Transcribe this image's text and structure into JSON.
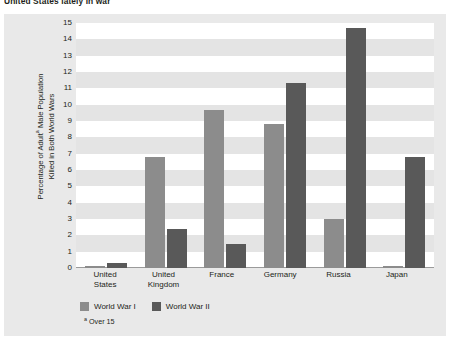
{
  "page": {
    "heading": "United States lately in war"
  },
  "chart_data": {
    "type": "bar",
    "title": "",
    "xlabel": "",
    "ylabel": "Percentage of Adultᵃ Male Population Killed in Both World Wars",
    "ylabel_line1": "Percentage of Adult",
    "ylabel_sup": "a",
    "ylabel_line2": " Male Population",
    "ylabel_line3": "Killed in Both World Wars",
    "categories": [
      "United States",
      "United Kingdom",
      "France",
      "Germany",
      "Russia",
      "Japan"
    ],
    "category_lines": [
      [
        "United",
        "States"
      ],
      [
        "United",
        "Kingdom"
      ],
      [
        "France",
        ""
      ],
      [
        "Germany",
        ""
      ],
      [
        "Russia",
        ""
      ],
      [
        "Japan",
        ""
      ]
    ],
    "series": [
      {
        "name": "World War I",
        "color": "#8c8c8c",
        "values": [
          0.1,
          6.8,
          9.7,
          8.8,
          3.0,
          0.1
        ]
      },
      {
        "name": "World War II",
        "color": "#595959",
        "values": [
          0.3,
          2.4,
          1.5,
          11.3,
          14.7,
          6.8
        ]
      }
    ],
    "yticks": [
      15,
      14,
      13,
      12,
      11,
      10,
      9,
      8,
      7,
      6,
      5,
      4,
      3,
      2,
      1,
      0
    ],
    "ylim": [
      0,
      15
    ],
    "grid": true,
    "grid_style": "alternating-horizontal-bands",
    "legend_position": "bottom-left",
    "footnote": "Over 15",
    "footnote_marker": "a"
  },
  "colors": {
    "panel_background": "#e9e9e9",
    "plot_background": "#ffffff",
    "band": "#e4e4e4",
    "axis": "#9a9a9a",
    "text": "#231f20",
    "series_ww1": "#8c8c8c",
    "series_ww2": "#595959"
  }
}
